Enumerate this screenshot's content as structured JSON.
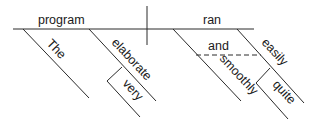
{
  "diagram": {
    "type": "sentence-diagram",
    "style": "Reed-Kellogg",
    "subject": "program",
    "verb": "ran",
    "modifiers": {
      "subject": [
        "The",
        "elaborate"
      ],
      "elaborate_modifier": "very",
      "verb": [
        "smoothly",
        "easily"
      ],
      "conjunction": "and",
      "easily_modifier": "quite"
    },
    "colors": {
      "line": "#2a2a2a",
      "text": "#1a1a1a",
      "background": "#ffffff"
    }
  }
}
